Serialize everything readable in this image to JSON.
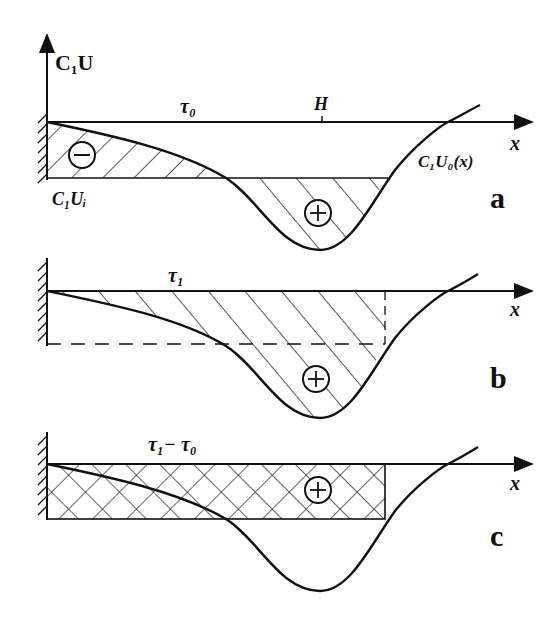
{
  "figure": {
    "y_axis_label": "C₁U",
    "panels": [
      {
        "id": "a",
        "panel_label": "a",
        "x_axis_label": "x",
        "time_label": "τ₀",
        "marker_label": "H",
        "curve_label": "C₁U₀(x)",
        "level_label": "C₁Uᵢ",
        "regions": [
          {
            "sign": "−",
            "description": "hatched region between axis level and curve near wall"
          },
          {
            "sign": "+",
            "description": "hatched region below level line in curve well"
          }
        ]
      },
      {
        "id": "b",
        "panel_label": "b",
        "x_axis_label": "x",
        "time_label": "τ₁",
        "regions": [
          {
            "sign": "+",
            "description": "hatched region above curve up to dashed vertical"
          }
        ]
      },
      {
        "id": "c",
        "panel_label": "c",
        "x_axis_label": "x",
        "time_label": "τ₁− τ₀",
        "regions": [
          {
            "sign": "+",
            "description": "cross-hatched rectangle"
          }
        ]
      }
    ],
    "colors": {
      "ink": "#111111",
      "background": "#ffffff"
    }
  }
}
